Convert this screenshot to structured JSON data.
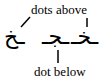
{
  "labels": {
    "top": "dots above",
    "bottom": "dot below"
  },
  "glyphs": [
    {
      "char": "ـخ",
      "dot": "above"
    },
    {
      "char": "ـجـ",
      "dot": "below"
    },
    {
      "char": "ـخـ",
      "dot": "above"
    }
  ]
}
